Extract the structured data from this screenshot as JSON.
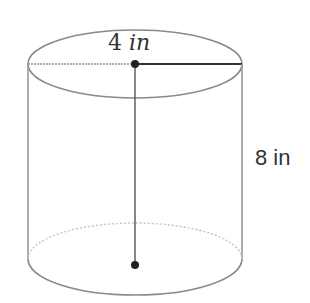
{
  "diagram": {
    "shape": "cylinder",
    "radius_label": {
      "number": "4",
      "unit": "in"
    },
    "height_label": "8 in",
    "colors": {
      "outline": "#888888",
      "dashed": "#bbbbbb",
      "axis": "#444444",
      "point": "#222222"
    }
  }
}
